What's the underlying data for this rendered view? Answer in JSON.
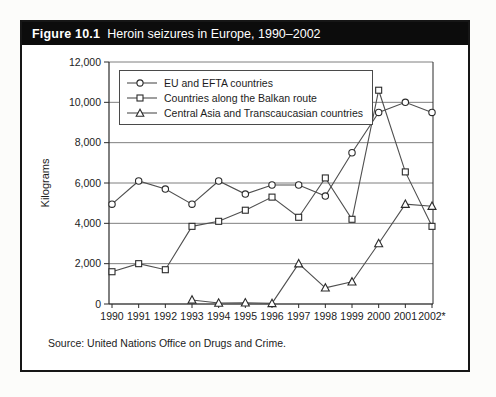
{
  "figure": {
    "label": "Figure 10.1",
    "title": "Heroin seizures in Europe, 1990–2002",
    "source": "Source: United Nations Office on Drugs and Crime."
  },
  "colors": {
    "header_bg": "#0c0c0c",
    "header_text": "#ffffff",
    "panel_border": "#161616",
    "grid": "#707070",
    "axis": "#2b2b2b",
    "series_line": "#4f4f4f",
    "marker_stroke": "#2b2b2b",
    "marker_fill": "#ffffff",
    "text": "#1c1c1c"
  },
  "chart_data": {
    "type": "line",
    "title": "Heroin seizures in Europe, 1990–2002",
    "xlabel": "",
    "ylabel": "Kilograms",
    "ylim": [
      0,
      12000
    ],
    "grid": true,
    "legend_position": "top-left-inside",
    "ytick_values": [
      0,
      2000,
      4000,
      6000,
      8000,
      10000,
      12000
    ],
    "ytick_labels": [
      "0",
      "2,000",
      "4,000",
      "6,000",
      "8,000",
      "10,000",
      "12,000"
    ],
    "categories": [
      "1990",
      "1991",
      "1992",
      "1993",
      "1994",
      "1995",
      "1996",
      "1997",
      "1998",
      "1999",
      "2000",
      "2001",
      "2002*"
    ],
    "series": [
      {
        "name": "EU and EFTA countries",
        "marker": "circle",
        "values": [
          4950,
          6100,
          5700,
          4950,
          6100,
          5450,
          5900,
          5900,
          5350,
          7500,
          9500,
          10000,
          9500
        ]
      },
      {
        "name": "Countries along the Balkan route",
        "marker": "square",
        "values": [
          1600,
          2000,
          1700,
          3850,
          4100,
          4650,
          5300,
          4300,
          6250,
          4200,
          10600,
          6550,
          3850
        ]
      },
      {
        "name": "Central Asia and Transcaucasian countries",
        "marker": "triangle",
        "values": [
          null,
          null,
          null,
          200,
          50,
          60,
          30,
          2000,
          800,
          1100,
          3000,
          4950,
          4850
        ]
      }
    ]
  }
}
